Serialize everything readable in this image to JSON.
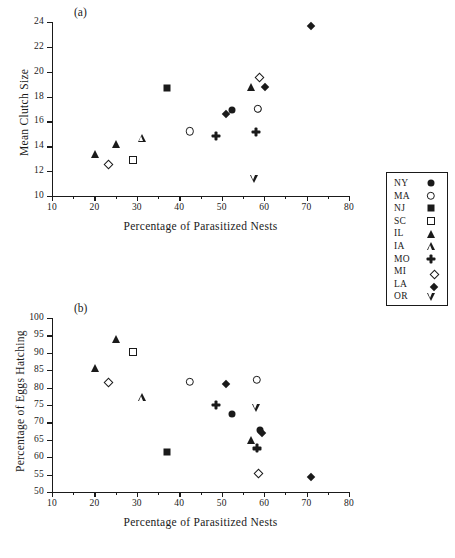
{
  "figure": {
    "panels": [
      {
        "tag": "(a)",
        "xlabel": "Percentage of Parasitized Nests",
        "ylabel": "Mean Clutch Size",
        "xticks": [
          10,
          20,
          30,
          40,
          50,
          60,
          70,
          80
        ],
        "yticks": [
          10,
          12,
          14,
          16,
          18,
          20,
          22,
          24
        ]
      },
      {
        "tag": "(b)",
        "xlabel": "Percentage of Parasitized Nests",
        "ylabel": "Percentage of Eggs Hatching",
        "xticks": [
          10,
          20,
          30,
          40,
          50,
          60,
          70,
          80
        ],
        "yticks": [
          50,
          55,
          60,
          65,
          70,
          75,
          80,
          85,
          90,
          95,
          100
        ]
      }
    ]
  },
  "legend": {
    "entries": [
      {
        "label": "NY",
        "marker": "circle-filled"
      },
      {
        "label": "MA",
        "marker": "circle-open"
      },
      {
        "label": "NJ",
        "marker": "square-filled"
      },
      {
        "label": "SC",
        "marker": "square-open"
      },
      {
        "label": "IL",
        "marker": "triangle-filled"
      },
      {
        "label": "IA",
        "marker": "triangle-open"
      },
      {
        "label": "MO",
        "marker": "plus-filled"
      },
      {
        "label": "MI",
        "marker": "diamond-open"
      },
      {
        "label": "LA",
        "marker": "diamond-filled"
      },
      {
        "label": "OR",
        "marker": "triangle-down-open"
      }
    ]
  },
  "chart_data": [
    {
      "type": "scatter",
      "panel": "(a)",
      "title": "Mean Clutch Size vs Percentage of Parasitized Nests",
      "xlabel": "Percentage of Parasitized Nests",
      "ylabel": "Mean Clutch Size",
      "xlim": [
        10,
        80
      ],
      "ylim": [
        10,
        24
      ],
      "xticks": [
        10,
        20,
        30,
        40,
        50,
        60,
        70,
        80
      ],
      "yticks": [
        10,
        12,
        14,
        16,
        18,
        20,
        22,
        24
      ],
      "grid": false,
      "legend_position": "right-outside",
      "series": [
        {
          "name": "NY",
          "marker": "circle-filled",
          "points": [
            [
              52.5,
              16.9
            ],
            [
              58.5,
              17.0
            ]
          ]
        },
        {
          "name": "MA",
          "marker": "circle-open",
          "points": [
            [
              42.5,
              15.2
            ],
            [
              58.5,
              17.0
            ]
          ]
        },
        {
          "name": "NJ",
          "marker": "square-filled",
          "points": [
            [
              37.0,
              18.7
            ]
          ]
        },
        {
          "name": "SC",
          "marker": "square-open",
          "points": [
            [
              29.0,
              12.9
            ]
          ]
        },
        {
          "name": "IL",
          "marker": "triangle-filled",
          "points": [
            [
              20.2,
              13.4
            ],
            [
              25.0,
              14.2
            ],
            [
              57.0,
              18.8
            ]
          ]
        },
        {
          "name": "IA",
          "marker": "triangle-open",
          "points": [
            [
              31.2,
              14.7
            ]
          ]
        },
        {
          "name": "MO",
          "marker": "plus-filled",
          "points": [
            [
              48.6,
              15.5
            ],
            [
              58.0,
              16.5
            ]
          ]
        },
        {
          "name": "MI",
          "marker": "diamond-open",
          "points": [
            [
              22.5,
              12.8
            ],
            [
              58.0,
              19.8
            ]
          ]
        },
        {
          "name": "LA",
          "marker": "diamond-filled",
          "points": [
            [
              50.2,
              16.8
            ],
            [
              59.5,
              19.0
            ],
            [
              70.3,
              23.9
            ]
          ]
        },
        {
          "name": "OR",
          "marker": "triangle-down-open",
          "points": [
            [
              57.7,
              13.5
            ]
          ]
        }
      ]
    },
    {
      "type": "scatter",
      "panel": "(b)",
      "title": "Percentage of Eggs Hatching vs Percentage of Parasitized Nests",
      "xlabel": "Percentage of Parasitized Nests",
      "ylabel": "Percentage of Eggs Hatching",
      "xlim": [
        10,
        80
      ],
      "ylim": [
        50,
        100
      ],
      "xticks": [
        10,
        20,
        30,
        40,
        50,
        60,
        70,
        80
      ],
      "yticks": [
        50,
        55,
        60,
        65,
        70,
        75,
        80,
        85,
        90,
        95,
        100
      ],
      "grid": false,
      "legend_position": "right-outside",
      "series": [
        {
          "name": "NY",
          "marker": "circle-filled",
          "points": [
            [
              52.5,
              72.5
            ],
            [
              59.0,
              67.8
            ]
          ]
        },
        {
          "name": "MA",
          "marker": "circle-open",
          "points": [
            [
              42.5,
              81.6
            ],
            [
              58.3,
              82.2
            ]
          ]
        },
        {
          "name": "NJ",
          "marker": "square-filled",
          "points": [
            [
              37.0,
              61.5
            ]
          ]
        },
        {
          "name": "SC",
          "marker": "square-open",
          "points": [
            [
              29.0,
              90.2
            ]
          ]
        },
        {
          "name": "IL",
          "marker": "triangle-filled",
          "points": [
            [
              20.2,
              85.7
            ],
            [
              25.0,
              94.0
            ],
            [
              57.0,
              64.9
            ]
          ]
        },
        {
          "name": "IA",
          "marker": "triangle-open",
          "points": [
            [
              31.2,
              77.2
            ]
          ]
        },
        {
          "name": "MO",
          "marker": "plus-filled",
          "points": [
            [
              48.6,
              77.3
            ],
            [
              58.2,
              67.4
            ]
          ]
        },
        {
          "name": "MI",
          "marker": "diamond-open",
          "points": [
            [
              22.5,
              82.6
            ],
            [
              57.8,
              56.3
            ]
          ]
        },
        {
          "name": "LA",
          "marker": "diamond-filled",
          "points": [
            [
              50.2,
              82.0
            ],
            [
              58.8,
              67.7
            ],
            [
              70.3,
              55.1
            ]
          ]
        },
        {
          "name": "OR",
          "marker": "triangle-down-open",
          "points": [
            [
              58.1,
              81.6
            ]
          ]
        }
      ]
    }
  ]
}
